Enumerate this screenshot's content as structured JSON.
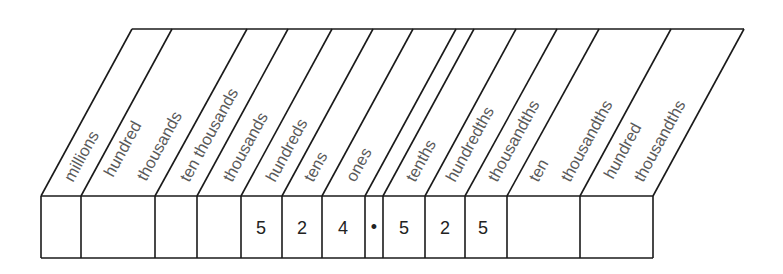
{
  "diagram": {
    "point_symbol": "•",
    "colors": {
      "line": "#1a1a1a",
      "label_text": "#5a5a5a",
      "digit_text": "#222222",
      "background": "#ffffff"
    },
    "columns": [
      {
        "name": "millions",
        "lines": [
          "millions"
        ],
        "value": ""
      },
      {
        "name": "hundred-thousands",
        "lines": [
          "hundred",
          "thousands"
        ],
        "value": ""
      },
      {
        "name": "ten-thousands",
        "lines": [
          "ten thousands"
        ],
        "value": ""
      },
      {
        "name": "thousands",
        "lines": [
          "thousands"
        ],
        "value": ""
      },
      {
        "name": "hundreds",
        "lines": [
          "hundreds"
        ],
        "value": "5"
      },
      {
        "name": "tens",
        "lines": [
          "tens"
        ],
        "value": "2"
      },
      {
        "name": "ones",
        "lines": [
          "ones"
        ],
        "value": "4"
      },
      {
        "name": "decimal-point",
        "lines": [],
        "value": "•"
      },
      {
        "name": "tenths",
        "lines": [
          "tenths"
        ],
        "value": "5"
      },
      {
        "name": "hundredths",
        "lines": [
          "hundredths"
        ],
        "value": "2"
      },
      {
        "name": "thousandths",
        "lines": [
          "thousandths"
        ],
        "value": "5"
      },
      {
        "name": "ten-thousandths",
        "lines": [
          "ten",
          "thousandths"
        ],
        "value": ""
      },
      {
        "name": "hundred-thousandths",
        "lines": [
          "hundred",
          "thousandths"
        ],
        "value": ""
      }
    ],
    "number_shown": "524.525"
  }
}
